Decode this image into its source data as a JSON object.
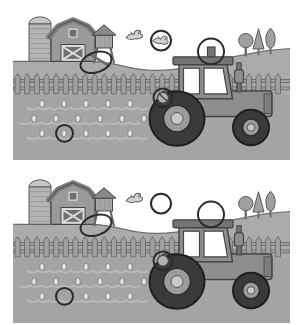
{
  "puzzle": {
    "type": "spot-the-difference",
    "theme": "farm-tractor-scene",
    "panel_count": 2,
    "difference_count": 5,
    "differences": [
      {
        "id": "second-bird",
        "description": "Right-hand flying bird present in top picture, missing in bottom picture",
        "marker_shape": "circle"
      },
      {
        "id": "water-tower-brace",
        "description": "Diagonal support brace on water tower legs present in top picture, missing in bottom picture",
        "marker_shape": "ellipse"
      },
      {
        "id": "cab-roof-stub",
        "description": "Small stack on tractor cab roof present in top picture, missing in bottom picture",
        "marker_shape": "circle"
      },
      {
        "id": "rear-lamp",
        "description": "Lamp behind rear wheel has diagonal cord in top picture, plain in bottom picture",
        "marker_shape": "circle"
      },
      {
        "id": "field-sprout",
        "description": "Crop sprout in plowed field present in top picture, missing in bottom picture",
        "marker_shape": "circle"
      }
    ],
    "panels": [
      {
        "id": "top",
        "role": "original",
        "features": {
          "second_bird": true,
          "tower_brace": true,
          "roof_stub": true,
          "field_sprout": true,
          "lamp_slash": true
        }
      },
      {
        "id": "bottom",
        "role": "changed",
        "features": {
          "second_bird": false,
          "tower_brace": false,
          "roof_stub": false,
          "field_sprout": false,
          "lamp_slash": false
        }
      }
    ],
    "scene_objects": [
      "silo",
      "barn",
      "water-tower",
      "flying-birds",
      "picket-fence",
      "plowed-field-with-sprouts",
      "tractor",
      "trees"
    ]
  },
  "colors": {
    "sky": "#ffffff",
    "ground": "#ababab",
    "horizon_line": "#6e6e6e",
    "field": "#a4a4a4",
    "furrow": "#b9b9b9",
    "sprout": "#e4e4e4",
    "fence": "#a0a0a0",
    "fence_line": "#5a5a5a",
    "outline": "#454545",
    "barn": "#9a9a9a",
    "barn_roof": "#7d7d7d",
    "barn_trim": "#dcdcdc",
    "door": "#6f6f6f",
    "silo": "#b5b5b5",
    "silo_dome": "#c6c6c6",
    "silo_stripe": "#979797",
    "tower": "#a6a6a6",
    "tower_roof": "#8a8a8a",
    "tower_leg": "#696969",
    "tractor": "#8e8e8e",
    "tractor_dark": "#757575",
    "grille": "#7c7c7c",
    "window": "#ffffff",
    "tire": "#3a3a3a",
    "tire_line": "#1e1e1e",
    "hub": "#9b9b9b",
    "hub_center": "#c9c9c9",
    "tree": "#a0a0a0",
    "tree_line": "#575757",
    "trunk": "#6f6f6f",
    "bird": "#d2d2d2",
    "bird_line": "#5a5a5a",
    "marker": "#2b2b2b"
  }
}
